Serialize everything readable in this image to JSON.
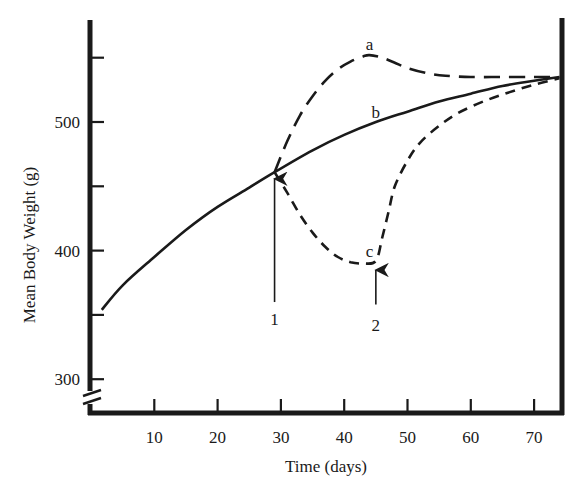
{
  "chart_data": {
    "type": "line",
    "title": "",
    "xlabel": "Time (days)",
    "ylabel": "Mean Body Weight (g)",
    "xlim": [
      0,
      74.5
    ],
    "ylim": [
      275,
      575
    ],
    "x_ticks": [
      10,
      20,
      30,
      40,
      50,
      60,
      70
    ],
    "x_tick_labels": [
      "10",
      "20",
      "30",
      "40",
      "50",
      "60",
      "70"
    ],
    "y_ticks": [
      300,
      350,
      400,
      450,
      500,
      550
    ],
    "y_tick_labels": [
      "300",
      "",
      "400",
      "",
      "500",
      ""
    ],
    "y_axis_break": true,
    "grid": false,
    "legend": "none (curves labeled directly)",
    "series": [
      {
        "name": "b",
        "style": "solid",
        "x": [
          1.7,
          5,
          10,
          15,
          20,
          25,
          29,
          35,
          40,
          45,
          50,
          55,
          60,
          65,
          70,
          74
        ],
        "y": [
          354,
          373,
          395,
          416,
          434,
          449,
          461,
          478,
          490,
          500,
          508,
          516,
          522,
          528,
          532,
          535
        ]
      },
      {
        "name": "a",
        "style": "long-dash",
        "x": [
          29,
          31,
          33,
          35,
          37,
          39,
          41,
          43,
          44,
          46,
          48,
          50,
          53,
          56,
          60,
          65,
          70,
          74
        ],
        "y": [
          461,
          485,
          505,
          520,
          532,
          541,
          547,
          551,
          552,
          550,
          546,
          542,
          538,
          536,
          535,
          535,
          535,
          535
        ]
      },
      {
        "name": "c",
        "style": "short-dash",
        "x": [
          29,
          31,
          33,
          35,
          37,
          39,
          41,
          43,
          45,
          46,
          47,
          48,
          50,
          52,
          55,
          58,
          62,
          66,
          70,
          74
        ],
        "y": [
          461,
          445,
          428,
          414,
          403,
          395,
          391,
          390,
          392,
          410,
          430,
          450,
          470,
          484,
          497,
          507,
          516,
          523,
          529,
          534
        ]
      }
    ],
    "annotations": [
      {
        "text": "a",
        "x": 44,
        "y": 556,
        "kind": "curve-label"
      },
      {
        "text": "b",
        "x": 45,
        "y": 503,
        "kind": "curve-label"
      },
      {
        "text": "c",
        "x": 44,
        "y": 395,
        "kind": "curve-label"
      },
      {
        "text": "1",
        "x": 29,
        "y": 350,
        "kind": "arrow-label",
        "arrow_from": [
          29,
          360
        ],
        "arrow_to": [
          29,
          459
        ]
      },
      {
        "text": "2",
        "x": 45,
        "y": 345,
        "kind": "arrow-label",
        "arrow_from": [
          45,
          358
        ],
        "arrow_to": [
          45,
          388
        ]
      }
    ]
  },
  "axes": {
    "x_title": "Time (days)",
    "y_title": "Mean Body Weight (g)"
  }
}
